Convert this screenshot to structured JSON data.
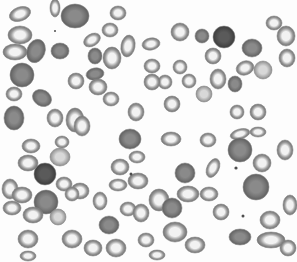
{
  "image": {
    "subject": "blood smear micrograph",
    "description": "Grayscale light-microscopy image of red blood cells; most cells show pale centers, several are uniformly dark round spherocytes, a few small dark dots (platelets) scattered",
    "width": 297,
    "height": 262,
    "background": "#fdfdfd"
  },
  "cells": [
    {
      "x": 20,
      "y": 14,
      "rx": 11,
      "ry": 7,
      "rot": -20,
      "type": "normal"
    },
    {
      "x": 55,
      "y": 8,
      "rx": 5,
      "ry": 9,
      "rot": 0,
      "type": "normal"
    },
    {
      "x": 75,
      "y": 16,
      "rx": 14,
      "ry": 12,
      "rot": 0,
      "type": "dark"
    },
    {
      "x": 118,
      "y": 13,
      "rx": 8,
      "ry": 7,
      "rot": 0,
      "type": "normal"
    },
    {
      "x": 20,
      "y": 35,
      "rx": 12,
      "ry": 9,
      "rot": 0,
      "type": "normal"
    },
    {
      "x": 15,
      "y": 52,
      "rx": 12,
      "ry": 8,
      "rot": 0,
      "type": "normal"
    },
    {
      "x": 36,
      "y": 51,
      "rx": 9,
      "ry": 12,
      "rot": 20,
      "type": "dark"
    },
    {
      "x": 60,
      "y": 51,
      "rx": 9,
      "ry": 8,
      "rot": 0,
      "type": "dark"
    },
    {
      "x": 92,
      "y": 40,
      "rx": 9,
      "ry": 6,
      "rot": -30,
      "type": "normal"
    },
    {
      "x": 110,
      "y": 30,
      "rx": 8,
      "ry": 7,
      "rot": 0,
      "type": "normal"
    },
    {
      "x": 95,
      "y": 56,
      "rx": 7,
      "ry": 8,
      "rot": 0,
      "type": "dark"
    },
    {
      "x": 112,
      "y": 58,
      "rx": 9,
      "ry": 11,
      "rot": 0,
      "type": "normal"
    },
    {
      "x": 128,
      "y": 46,
      "rx": 7,
      "ry": 11,
      "rot": 10,
      "type": "normal"
    },
    {
      "x": 151,
      "y": 44,
      "rx": 9,
      "ry": 6,
      "rot": -10,
      "type": "normal"
    },
    {
      "x": 22,
      "y": 75,
      "rx": 12,
      "ry": 12,
      "rot": 0,
      "type": "dark"
    },
    {
      "x": 14,
      "y": 94,
      "rx": 8,
      "ry": 7,
      "rot": 0,
      "type": "normal"
    },
    {
      "x": 42,
      "y": 98,
      "rx": 10,
      "ry": 8,
      "rot": 30,
      "type": "dark"
    },
    {
      "x": 76,
      "y": 81,
      "rx": 8,
      "ry": 8,
      "rot": 0,
      "type": "normal"
    },
    {
      "x": 95,
      "y": 74,
      "rx": 9,
      "ry": 6,
      "rot": -10,
      "type": "dark"
    },
    {
      "x": 98,
      "y": 87,
      "rx": 9,
      "ry": 8,
      "rot": 0,
      "type": "normal"
    },
    {
      "x": 111,
      "y": 99,
      "rx": 8,
      "ry": 7,
      "rot": 0,
      "type": "normal"
    },
    {
      "x": 136,
      "y": 112,
      "rx": 8,
      "ry": 9,
      "rot": 0,
      "type": "normal"
    },
    {
      "x": 14,
      "y": 118,
      "rx": 10,
      "ry": 12,
      "rot": 0,
      "type": "dark"
    },
    {
      "x": 55,
      "y": 118,
      "rx": 8,
      "ry": 9,
      "rot": 0,
      "type": "normal"
    },
    {
      "x": 75,
      "y": 120,
      "rx": 9,
      "ry": 12,
      "rot": 0,
      "type": "normal"
    },
    {
      "x": 82,
      "y": 126,
      "rx": 8,
      "ry": 10,
      "rot": 0,
      "type": "normal"
    },
    {
      "x": 152,
      "y": 66,
      "rx": 8,
      "ry": 7,
      "rot": 0,
      "type": "normal"
    },
    {
      "x": 165,
      "y": 82,
      "rx": 7,
      "ry": 7,
      "rot": 0,
      "type": "normal"
    },
    {
      "x": 152,
      "y": 82,
      "rx": 8,
      "ry": 8,
      "rot": 0,
      "type": "normal"
    },
    {
      "x": 180,
      "y": 32,
      "rx": 9,
      "ry": 9,
      "rot": 0,
      "type": "normal"
    },
    {
      "x": 202,
      "y": 36,
      "rx": 7,
      "ry": 7,
      "rot": 0,
      "type": "dark"
    },
    {
      "x": 224,
      "y": 37,
      "rx": 11,
      "ry": 11,
      "rot": 0,
      "type": "darkest"
    },
    {
      "x": 213,
      "y": 56,
      "rx": 8,
      "ry": 8,
      "rot": 0,
      "type": "normal"
    },
    {
      "x": 252,
      "y": 48,
      "rx": 10,
      "ry": 9,
      "rot": 0,
      "type": "dark"
    },
    {
      "x": 180,
      "y": 67,
      "rx": 7,
      "ry": 7,
      "rot": 0,
      "type": "normal"
    },
    {
      "x": 189,
      "y": 81,
      "rx": 7,
      "ry": 7,
      "rot": 0,
      "type": "normal"
    },
    {
      "x": 218,
      "y": 79,
      "rx": 8,
      "ry": 10,
      "rot": 0,
      "type": "normal"
    },
    {
      "x": 235,
      "y": 84,
      "rx": 7,
      "ry": 8,
      "rot": 0,
      "type": "dark"
    },
    {
      "x": 245,
      "y": 68,
      "rx": 9,
      "ry": 7,
      "rot": -20,
      "type": "normal"
    },
    {
      "x": 263,
      "y": 70,
      "rx": 9,
      "ry": 9,
      "rot": 0,
      "type": "light"
    },
    {
      "x": 274,
      "y": 23,
      "rx": 8,
      "ry": 7,
      "rot": 0,
      "type": "normal"
    },
    {
      "x": 286,
      "y": 36,
      "rx": 9,
      "ry": 10,
      "rot": 0,
      "type": "normal"
    },
    {
      "x": 287,
      "y": 58,
      "rx": 8,
      "ry": 9,
      "rot": 0,
      "type": "normal"
    },
    {
      "x": 204,
      "y": 94,
      "rx": 8,
      "ry": 8,
      "rot": 0,
      "type": "light"
    },
    {
      "x": 172,
      "y": 104,
      "rx": 8,
      "ry": 8,
      "rot": 0,
      "type": "normal"
    },
    {
      "x": 237,
      "y": 112,
      "rx": 7,
      "ry": 7,
      "rot": 0,
      "type": "normal"
    },
    {
      "x": 258,
      "y": 112,
      "rx": 8,
      "ry": 8,
      "rot": 0,
      "type": "normal"
    },
    {
      "x": 171,
      "y": 139,
      "rx": 10,
      "ry": 7,
      "rot": 0,
      "type": "normal"
    },
    {
      "x": 208,
      "y": 140,
      "rx": 8,
      "ry": 7,
      "rot": 0,
      "type": "normal"
    },
    {
      "x": 240,
      "y": 134,
      "rx": 10,
      "ry": 5,
      "rot": -15,
      "type": "normal"
    },
    {
      "x": 258,
      "y": 132,
      "rx": 8,
      "ry": 5,
      "rot": 0,
      "type": "normal"
    },
    {
      "x": 240,
      "y": 150,
      "rx": 12,
      "ry": 12,
      "rot": 0,
      "type": "dark"
    },
    {
      "x": 262,
      "y": 163,
      "rx": 9,
      "ry": 9,
      "rot": 0,
      "type": "normal"
    },
    {
      "x": 185,
      "y": 173,
      "rx": 10,
      "ry": 10,
      "rot": 0,
      "type": "dark"
    },
    {
      "x": 213,
      "y": 168,
      "rx": 6,
      "ry": 10,
      "rot": 25,
      "type": "normal"
    },
    {
      "x": 256,
      "y": 187,
      "rx": 13,
      "ry": 13,
      "rot": 0,
      "type": "dark"
    },
    {
      "x": 188,
      "y": 194,
      "rx": 11,
      "ry": 8,
      "rot": 0,
      "type": "normal"
    },
    {
      "x": 159,
      "y": 200,
      "rx": 10,
      "ry": 11,
      "rot": 0,
      "type": "normal"
    },
    {
      "x": 172,
      "y": 208,
      "rx": 10,
      "ry": 10,
      "rot": 0,
      "type": "dark"
    },
    {
      "x": 209,
      "y": 194,
      "rx": 9,
      "ry": 7,
      "rot": 0,
      "type": "normal"
    },
    {
      "x": 221,
      "y": 212,
      "rx": 8,
      "ry": 8,
      "rot": 0,
      "type": "normal"
    },
    {
      "x": 285,
      "y": 150,
      "rx": 8,
      "ry": 10,
      "rot": 0,
      "type": "normal"
    },
    {
      "x": 290,
      "y": 205,
      "rx": 7,
      "ry": 10,
      "rot": 0,
      "type": "normal"
    },
    {
      "x": 270,
      "y": 220,
      "rx": 10,
      "ry": 9,
      "rot": 0,
      "type": "normal"
    },
    {
      "x": 175,
      "y": 232,
      "rx": 12,
      "ry": 10,
      "rot": 0,
      "type": "normal"
    },
    {
      "x": 195,
      "y": 245,
      "rx": 10,
      "ry": 8,
      "rot": 0,
      "type": "normal"
    },
    {
      "x": 240,
      "y": 237,
      "rx": 11,
      "ry": 8,
      "rot": 0,
      "type": "dark"
    },
    {
      "x": 271,
      "y": 240,
      "rx": 14,
      "ry": 8,
      "rot": 0,
      "type": "normal"
    },
    {
      "x": 288,
      "y": 248,
      "rx": 8,
      "ry": 8,
      "rot": 0,
      "type": "normal"
    },
    {
      "x": 157,
      "y": 255,
      "rx": 8,
      "ry": 5,
      "rot": 0,
      "type": "normal"
    },
    {
      "x": 31,
      "y": 146,
      "rx": 9,
      "ry": 7,
      "rot": 0,
      "type": "normal"
    },
    {
      "x": 62,
      "y": 142,
      "rx": 7,
      "ry": 6,
      "rot": 0,
      "type": "normal"
    },
    {
      "x": 60,
      "y": 157,
      "rx": 10,
      "ry": 9,
      "rot": 0,
      "type": "light"
    },
    {
      "x": 130,
      "y": 139,
      "rx": 11,
      "ry": 10,
      "rot": 0,
      "type": "dark"
    },
    {
      "x": 137,
      "y": 157,
      "rx": 8,
      "ry": 6,
      "rot": 0,
      "type": "normal"
    },
    {
      "x": 28,
      "y": 163,
      "rx": 10,
      "ry": 8,
      "rot": 0,
      "type": "normal"
    },
    {
      "x": 45,
      "y": 174,
      "rx": 11,
      "ry": 11,
      "rot": 0,
      "type": "darkest"
    },
    {
      "x": 64,
      "y": 184,
      "rx": 8,
      "ry": 7,
      "rot": 0,
      "type": "normal"
    },
    {
      "x": 80,
      "y": 191,
      "rx": 9,
      "ry": 8,
      "rot": 0,
      "type": "normal"
    },
    {
      "x": 120,
      "y": 167,
      "rx": 9,
      "ry": 8,
      "rot": 0,
      "type": "normal"
    },
    {
      "x": 118,
      "y": 185,
      "rx": 9,
      "ry": 6,
      "rot": 0,
      "type": "normal"
    },
    {
      "x": 138,
      "y": 181,
      "rx": 10,
      "ry": 8,
      "rot": 0,
      "type": "normal"
    },
    {
      "x": 10,
      "y": 189,
      "rx": 8,
      "ry": 10,
      "rot": 0,
      "type": "normal"
    },
    {
      "x": 22,
      "y": 195,
      "rx": 10,
      "ry": 8,
      "rot": 0,
      "type": "normal"
    },
    {
      "x": 46,
      "y": 202,
      "rx": 12,
      "ry": 12,
      "rot": 0,
      "type": "dark"
    },
    {
      "x": 12,
      "y": 208,
      "rx": 9,
      "ry": 7,
      "rot": 0,
      "type": "normal"
    },
    {
      "x": 72,
      "y": 194,
      "rx": 7,
      "ry": 7,
      "rot": 0,
      "type": "normal"
    },
    {
      "x": 100,
      "y": 201,
      "rx": 7,
      "ry": 9,
      "rot": 0,
      "type": "normal"
    },
    {
      "x": 128,
      "y": 209,
      "rx": 8,
      "ry": 7,
      "rot": 0,
      "type": "normal"
    },
    {
      "x": 141,
      "y": 213,
      "rx": 8,
      "ry": 9,
      "rot": 0,
      "type": "normal"
    },
    {
      "x": 33,
      "y": 215,
      "rx": 10,
      "ry": 8,
      "rot": 0,
      "type": "normal"
    },
    {
      "x": 58,
      "y": 217,
      "rx": 8,
      "ry": 8,
      "rot": 0,
      "type": "light"
    },
    {
      "x": 28,
      "y": 239,
      "rx": 10,
      "ry": 9,
      "rot": 0,
      "type": "normal"
    },
    {
      "x": 72,
      "y": 239,
      "rx": 10,
      "ry": 9,
      "rot": 0,
      "type": "normal"
    },
    {
      "x": 109,
      "y": 225,
      "rx": 10,
      "ry": 9,
      "rot": 0,
      "type": "dark"
    },
    {
      "x": 93,
      "y": 248,
      "rx": 9,
      "ry": 8,
      "rot": 0,
      "type": "normal"
    },
    {
      "x": 116,
      "y": 248,
      "rx": 10,
      "ry": 9,
      "rot": 0,
      "type": "normal"
    },
    {
      "x": 146,
      "y": 240,
      "rx": 8,
      "ry": 7,
      "rot": 0,
      "type": "normal"
    },
    {
      "x": 28,
      "y": 256,
      "rx": 8,
      "ry": 5,
      "rot": 0,
      "type": "normal"
    }
  ],
  "platelets": [
    {
      "x": 55,
      "y": 31,
      "r": 1
    },
    {
      "x": 236,
      "y": 168,
      "r": 1.6
    },
    {
      "x": 243,
      "y": 216,
      "r": 1.5
    },
    {
      "x": 131,
      "y": 174,
      "r": 1.5
    }
  ],
  "palette": {
    "normal": {
      "center": "#f2f2f2",
      "mid": "#9a9a9a",
      "edge": "#6f6f6f"
    },
    "light": {
      "center": "#d8d8d8",
      "mid": "#b0b0b0",
      "edge": "#8c8c8c"
    },
    "dark": {
      "center": "#8a8a8a",
      "mid": "#747474",
      "edge": "#5e5e5e"
    },
    "darkest": {
      "center": "#5a5a5a",
      "mid": "#4a4a4a",
      "edge": "#3a3a3a"
    },
    "platelet": "#4d4d4d"
  }
}
